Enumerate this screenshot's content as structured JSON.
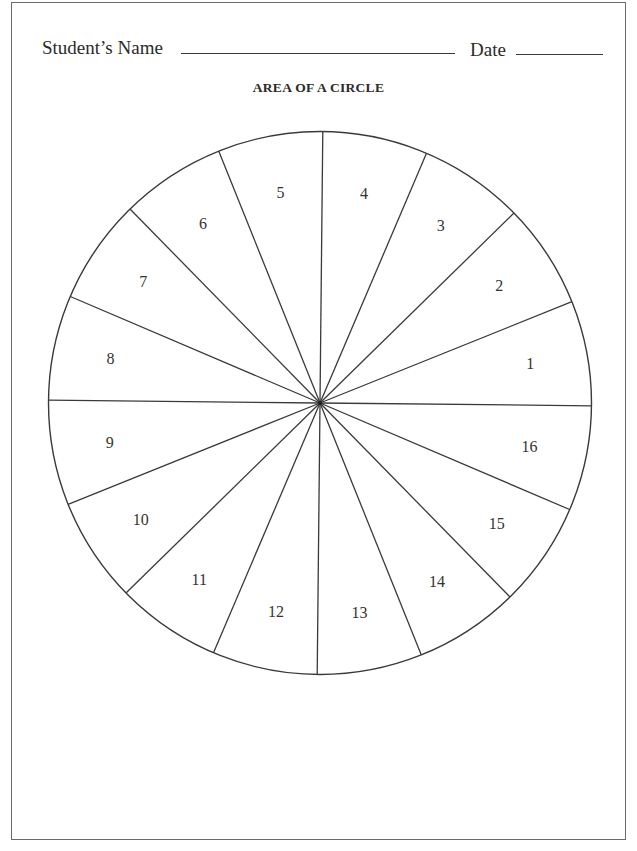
{
  "header": {
    "student_name_label": "Student’s Name",
    "date_label": "Date",
    "student_name_value": "",
    "date_value": ""
  },
  "title": "AREA OF A CIRCLE",
  "circle": {
    "segment_count": 16,
    "stroke_color": "#3a3a3a",
    "segments": [
      {
        "label": "1"
      },
      {
        "label": "2"
      },
      {
        "label": "3"
      },
      {
        "label": "4"
      },
      {
        "label": "5"
      },
      {
        "label": "6"
      },
      {
        "label": "7"
      },
      {
        "label": "8"
      },
      {
        "label": "9"
      },
      {
        "label": "10"
      },
      {
        "label": "11"
      },
      {
        "label": "12"
      },
      {
        "label": "13"
      },
      {
        "label": "14"
      },
      {
        "label": "15"
      },
      {
        "label": "16"
      }
    ]
  }
}
